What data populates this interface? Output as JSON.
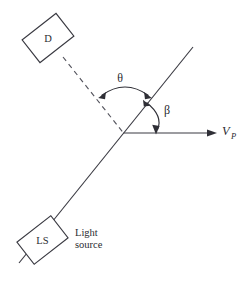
{
  "figure": {
    "background_color": "#ffffff",
    "line_color": "#3a3a42",
    "text_color": "#2b2b31",
    "width": 245,
    "height": 281
  },
  "detector": {
    "box_label": "D",
    "box_name": "detector"
  },
  "light_source": {
    "box_label": "LS",
    "caption_line1": "Light",
    "caption_line2": "source"
  },
  "angles": {
    "theta": "θ",
    "beta": "β"
  },
  "velocity": {
    "symbol": "V",
    "subscript": "P"
  }
}
